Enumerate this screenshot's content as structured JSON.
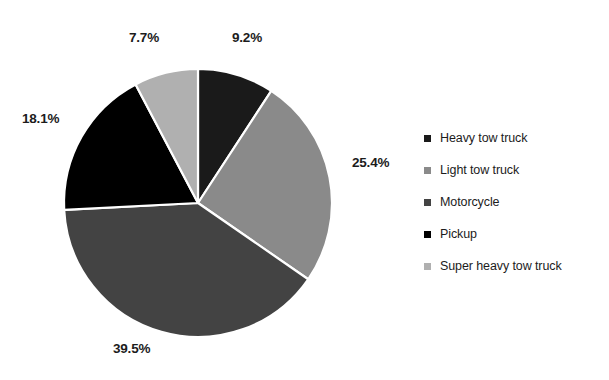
{
  "chart_data": {
    "type": "pie",
    "title": "",
    "categories": [
      "Heavy tow  truck",
      "Light tow truck",
      "Motorcycle",
      "Pickup",
      "Super heavy tow  truck"
    ],
    "values": [
      9.2,
      25.4,
      39.5,
      18.1,
      7.7
    ],
    "value_labels": [
      "9.2%",
      "25.4%",
      "39.5%",
      "18.1%",
      "7.7%"
    ],
    "colors": [
      "#1a1a1a",
      "#8a8a8a",
      "#434343",
      "#000000",
      "#b0b0b0"
    ],
    "start_angle_deg": 0,
    "direction": "clockwise",
    "legend_position": "right",
    "grid": false,
    "labels_outside": true,
    "slice_border_color": "#ffffff",
    "background": "#ffffff"
  },
  "labels": {
    "heavy": "9.2%",
    "light": "25.4%",
    "motorcycle": "39.5%",
    "pickup": "18.1%",
    "super_heavy": "7.7%"
  },
  "legend": {
    "items": [
      {
        "label": "Heavy tow  truck",
        "color": "#1a1a1a"
      },
      {
        "label": "Light tow truck",
        "color": "#8a8a8a"
      },
      {
        "label": "Motorcycle",
        "color": "#434343"
      },
      {
        "label": "Pickup",
        "color": "#000000"
      },
      {
        "label": "Super heavy tow  truck",
        "color": "#b0b0b0"
      }
    ]
  }
}
